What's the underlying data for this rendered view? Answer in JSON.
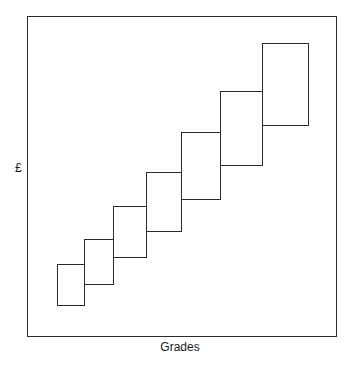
{
  "diagram": {
    "y_axis_label": "£",
    "x_axis_label": "Grades",
    "grades": [
      {
        "index": 1,
        "x": 57,
        "y": 264,
        "w": 28,
        "h": 42
      },
      {
        "index": 2,
        "x": 84,
        "y": 239,
        "w": 30,
        "h": 46
      },
      {
        "index": 3,
        "x": 113,
        "y": 206,
        "w": 34,
        "h": 52
      },
      {
        "index": 4,
        "x": 146,
        "y": 172,
        "w": 36,
        "h": 60
      },
      {
        "index": 5,
        "x": 181,
        "y": 132,
        "w": 40,
        "h": 68
      },
      {
        "index": 6,
        "x": 220,
        "y": 91,
        "w": 43,
        "h": 75
      },
      {
        "index": 7,
        "x": 262,
        "y": 43,
        "w": 47,
        "h": 83
      }
    ]
  }
}
